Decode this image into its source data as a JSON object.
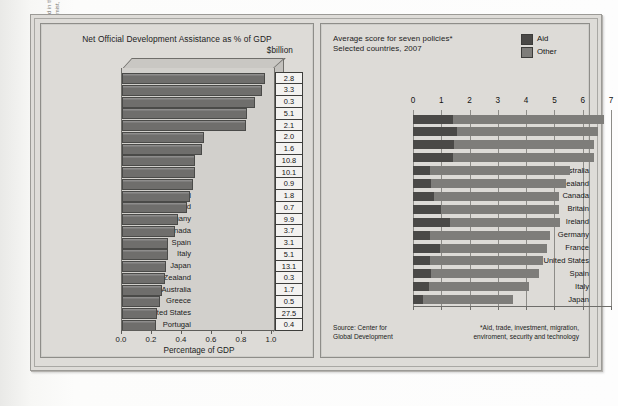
{
  "caption": {
    "line1": "Aid data from the Organisation for Economic Cooperation and Development (OECD), presented in the Economist, April 15, 2006,",
    "line2": "p. 96. Index of development commitment data from the Center for Global Development (Economist, October 13, 2007, p. 113)."
  },
  "left_panel": {
    "title": "Net Official Development Assistance as % of GDP",
    "unit_label": "$billion",
    "xlabel": "Percentage of GDP"
  },
  "right_panel": {
    "title_line1": "Average score for seven policies*",
    "title_line2": "Selected countries, 2007",
    "legend": [
      {
        "label": "Aid",
        "color": "#4a4947"
      },
      {
        "label": "Other",
        "color": "#7e7d7a"
      }
    ],
    "source_line1": "Source: Center for",
    "source_line2": "Global Development",
    "note_line1": "*Aid, trade, investment, migration,",
    "note_line2": "enviroment, security and technology"
  },
  "chart_data": [
    {
      "type": "bar",
      "title": "Net Official Development Assistance as % of GDP",
      "xlabel": "Percentage of GDP",
      "ylabel": "",
      "xlim": [
        0.0,
        1.0
      ],
      "orientation": "horizontal",
      "grid": false,
      "xticks": [
        "0.0",
        "0.2",
        "0.4",
        "0.6",
        "0.8",
        "1.0"
      ],
      "xtick_values": [
        0.0,
        0.2,
        0.4,
        0.6,
        0.8,
        1.0
      ],
      "value_label_header": "$billion",
      "categories": [
        "Norway",
        "Sweden",
        "Luxembourg",
        "Netherlands",
        "Denmark",
        "Belgium",
        "Austria",
        "Britain",
        "France",
        "Finland",
        "Switzerland",
        "Ireland",
        "Germany",
        "Canada",
        "Spain",
        "Italy",
        "Japan",
        "New Zealand",
        "Australia",
        "Greece",
        "United States",
        "Portugal"
      ],
      "values": [
        0.94,
        0.92,
        0.87,
        0.82,
        0.81,
        0.53,
        0.52,
        0.47,
        0.47,
        0.46,
        0.44,
        0.42,
        0.36,
        0.34,
        0.29,
        0.29,
        0.28,
        0.27,
        0.25,
        0.24,
        0.22,
        0.21
      ],
      "data_labels": [
        "2.8",
        "3.3",
        "0.3",
        "5.1",
        "2.1",
        "2.0",
        "1.6",
        "10.8",
        "10.1",
        "0.9",
        "1.8",
        "0.7",
        "9.9",
        "3.7",
        "3.1",
        "5.1",
        "13.1",
        "0.3",
        "1.7",
        "0.5",
        "27.5",
        "0.4"
      ]
    },
    {
      "type": "bar",
      "title": "Average score for seven policies*",
      "subtitle": "Selected countries, 2007",
      "xlabel": "",
      "ylabel": "",
      "xlim": [
        0,
        7
      ],
      "orientation": "horizontal",
      "stacked": true,
      "grid": true,
      "legend_position": "top-right",
      "xticks": [
        "0",
        "1",
        "2",
        "3",
        "4",
        "5",
        "6",
        "7"
      ],
      "xtick_values": [
        0,
        1,
        2,
        3,
        4,
        5,
        6,
        7
      ],
      "categories": [
        "Netherlands",
        "Denmark",
        "Sweden",
        "Norway",
        "Australia",
        "New Zealand",
        "Canada",
        "Britain",
        "Ireland",
        "Germany",
        "France",
        "United States",
        "Spain",
        "Italy",
        "Japan"
      ],
      "series": [
        {
          "name": "Aid",
          "values": [
            1.4,
            1.55,
            1.45,
            1.4,
            0.6,
            0.65,
            0.75,
            1.0,
            1.3,
            0.6,
            0.95,
            0.6,
            0.65,
            0.55,
            0.35
          ]
        },
        {
          "name": "Other",
          "values": [
            5.35,
            5.0,
            4.95,
            5.0,
            4.95,
            4.75,
            4.4,
            4.15,
            3.9,
            4.25,
            3.8,
            4.0,
            3.8,
            3.55,
            3.2
          ]
        }
      ],
      "totals": [
        6.75,
        6.55,
        6.4,
        6.4,
        5.55,
        5.4,
        5.15,
        5.15,
        5.2,
        4.85,
        4.75,
        4.6,
        4.45,
        4.1,
        3.55
      ]
    }
  ]
}
